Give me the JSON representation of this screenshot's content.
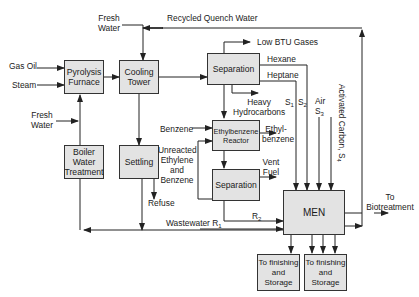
{
  "diagram": {
    "colors": {
      "box_fill": "#e3e3e3",
      "line": "#222222"
    },
    "units": {
      "pyrolysis_furnace": "Pyrolysis Furnace",
      "cooling_tower": "Cooling Tower",
      "separation_top": "Separation",
      "ethylbenzene_reactor": "Ethylbenzene Reactor",
      "separation_bottom": "Separation",
      "boiler_water_treatment": "Boiler Water Treatment",
      "settling": "Settling",
      "men": "MEN",
      "finishing_1": "To finishing and Storage",
      "finishing_2": "To finishing and Storage"
    },
    "streams": {
      "gas_oil": "Gas Oil",
      "steam": "Steam",
      "fresh_water_top": "Fresh Water",
      "fresh_water_left": "Fresh Water",
      "recycled_quench_water": "Recycled Quench Water",
      "low_btu_gases": "Low BTU Gases",
      "hexane": "Hexane",
      "heptane": "Heptane",
      "heavy_hydrocarbons": "Heavy Hydrocarbons",
      "s1": "S",
      "s1_sub": "1",
      "s2": "S",
      "s2_sub": "2",
      "air": "Air",
      "s3": "S",
      "s3_sub": "3",
      "activated_carbon": "Activated Carbon, S",
      "activated_carbon_sub": "4",
      "benzene": "Benzene",
      "ethylbenzene_out": "Ethyl- benzene",
      "unreacted": "Unreacted Ethylene and Benzene",
      "vent_fuel": "Vent Fuel",
      "refuse": "Refuse",
      "wastewater": "Wastewater R",
      "wastewater_sub": "1",
      "r2": "R",
      "r2_sub": "2",
      "to_biotreatment": "To Biotreatment"
    }
  }
}
